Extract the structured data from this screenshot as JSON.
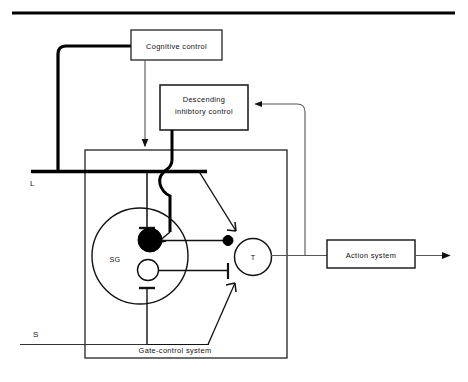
{
  "diagram": {
    "colors": {
      "stroke": "#111111",
      "thick_stroke": "#000000",
      "background": "#ffffff",
      "fill_solid": "#000000",
      "fill_open": "#ffffff"
    },
    "top_rule": {
      "name": "top-divider-rule"
    },
    "boxes": [
      {
        "id": "cognitive-control",
        "label": "Cognitive control",
        "x": 131,
        "y": 30,
        "w": 91,
        "h": 30
      },
      {
        "id": "descending-inhibitory-control",
        "label_line1": "Descending",
        "label_line2": "inhibtory control",
        "x": 160,
        "y": 85,
        "w": 88,
        "h": 45
      },
      {
        "id": "action-system",
        "label": "Action system",
        "x": 327,
        "y": 240,
        "w": 88,
        "h": 27
      },
      {
        "id": "gate-control-system",
        "label": "Gate-control system",
        "x": 85,
        "y": 150,
        "w": 202,
        "h": 208
      }
    ],
    "nodes": [
      {
        "id": "sg-circle",
        "label": "SG",
        "cx": 140,
        "cy": 256,
        "r": 48
      },
      {
        "id": "sg-excitatory-neuron",
        "label": "",
        "cx": 150,
        "cy": 240,
        "r": 12
      },
      {
        "id": "sg-inhibitory-neuron",
        "label": "",
        "cx": 148,
        "cy": 270,
        "r": 10
      },
      {
        "id": "t-cell",
        "label": "T",
        "cx": 253,
        "cy": 257,
        "r": 18
      },
      {
        "id": "t-cell-input-terminal",
        "label": "",
        "cx": 228,
        "cy": 241,
        "r": 5
      }
    ],
    "input_lines": [
      {
        "id": "large-fiber-input",
        "label": "L",
        "label_x": 33,
        "label_y": 185,
        "y": 172,
        "x_start": 33,
        "x_end": 207,
        "weight": "thick"
      },
      {
        "id": "small-fiber-input",
        "label": "S",
        "label_x": 36,
        "label_y": 333,
        "y": 344,
        "x_start": 20,
        "x_end": 168,
        "weight": "thin"
      }
    ],
    "output": {
      "id": "action-output-arrow",
      "label": ""
    },
    "feedback": {
      "id": "descending-feedback-loop",
      "label": ""
    }
  }
}
